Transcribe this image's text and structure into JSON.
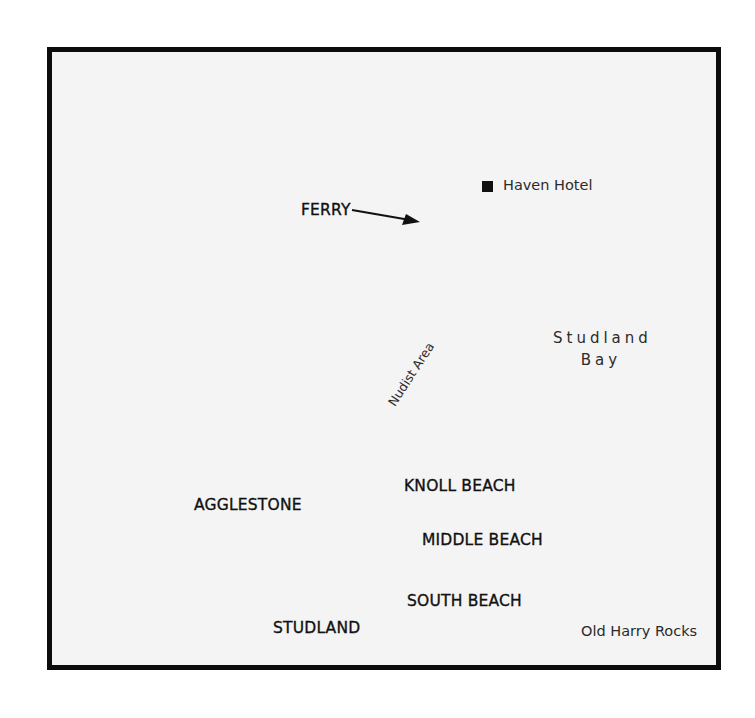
{
  "map": {
    "title": "",
    "background_color": "#f4f4f4",
    "border_color": "#0c0c0c",
    "labels": {
      "haven_hotel": "Haven Hotel",
      "ferry": "FERRY",
      "studland_bay_line1": "Studland",
      "studland_bay_line2": "Bay",
      "nudist_area": "Nudist Area",
      "agglestone": "AGGLESTONE",
      "knoll_beach": "KNOLL BEACH",
      "middle_beach": "MIDDLE BEACH",
      "south_beach": "SOUTH BEACH",
      "studland": "STUDLAND",
      "old_harry_rocks": "Old Harry Rocks"
    },
    "markers": [
      {
        "name": "Haven Hotel",
        "symbol": "filled-square"
      },
      {
        "name": "FERRY",
        "symbol": "arrow-right"
      }
    ]
  }
}
